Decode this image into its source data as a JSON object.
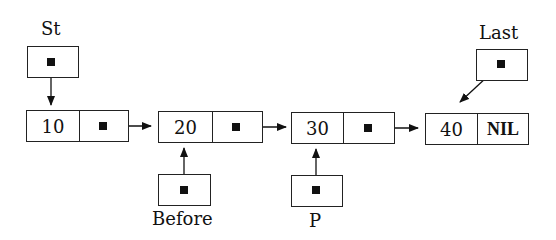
{
  "diagram": {
    "type": "singly-linked-list",
    "nodes": [
      {
        "id": "n1",
        "value": "10",
        "next": "n2"
      },
      {
        "id": "n2",
        "value": "20",
        "next": "n3"
      },
      {
        "id": "n3",
        "value": "30",
        "next": "n4"
      },
      {
        "id": "n4",
        "value": "40",
        "next_label": "NIL"
      }
    ],
    "pointers": [
      {
        "name": "St",
        "points_to": "n1"
      },
      {
        "name": "Before",
        "points_to": "n2"
      },
      {
        "name": "P",
        "points_to": "n3"
      },
      {
        "name": "Last",
        "points_to": "n4"
      }
    ]
  }
}
